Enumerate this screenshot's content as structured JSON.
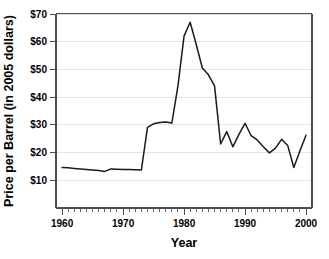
{
  "chart_data": {
    "type": "line",
    "title": "",
    "xlabel": "Year",
    "ylabel": "Price per Barrel (in 2005 dollars)",
    "xlim": [
      1959,
      2001
    ],
    "ylim": [
      0,
      70
    ],
    "xticks": [
      1960,
      1970,
      1980,
      1990,
      2000
    ],
    "xticklabels": [
      "1960",
      "1970",
      "1980",
      "1990",
      "2000"
    ],
    "yticks": [
      10,
      20,
      30,
      40,
      50,
      60,
      70
    ],
    "yticklabels": [
      "$10",
      "$20",
      "$30",
      "$40",
      "$50",
      "$60",
      "$70"
    ],
    "grid": "horizontal",
    "legend": "none",
    "minor_xtick_interval": 1,
    "series": [
      {
        "name": "Crude oil price",
        "color": "#1a1a1a",
        "x": [
          1960,
          1961,
          1962,
          1963,
          1964,
          1965,
          1966,
          1967,
          1968,
          1969,
          1970,
          1971,
          1972,
          1973,
          1974,
          1975,
          1976,
          1977,
          1978,
          1979,
          1980,
          1981,
          1982,
          1983,
          1984,
          1985,
          1986,
          1987,
          1988,
          1989,
          1990,
          1991,
          1992,
          1993,
          1994,
          1995,
          1996,
          1997,
          1998,
          1999,
          2000
        ],
        "values": [
          14.5,
          14.4,
          14.2,
          14.0,
          13.8,
          13.6,
          13.4,
          13.1,
          14.0,
          13.9,
          13.8,
          13.8,
          13.7,
          13.6,
          29.0,
          30.3,
          30.8,
          31.0,
          30.6,
          44.0,
          62.0,
          67.0,
          59.0,
          50.5,
          48.0,
          44.0,
          23.0,
          27.5,
          22.0,
          26.5,
          30.5,
          26.0,
          24.5,
          22.0,
          19.8,
          21.5,
          24.7,
          22.5,
          14.5,
          20.5,
          26.2
        ]
      }
    ]
  },
  "axes": {
    "y_title": "Price per Barrel (in 2005 dollars)",
    "x_title": "Year"
  }
}
